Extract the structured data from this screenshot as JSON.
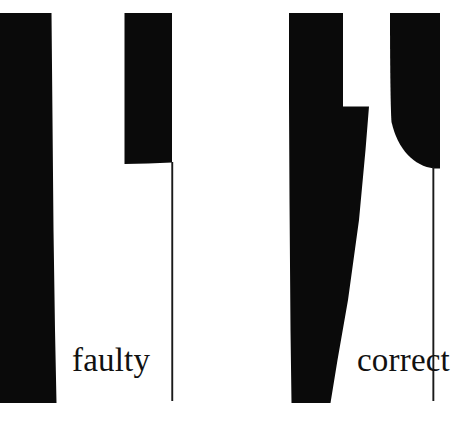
{
  "figure": {
    "background_color": "#ffffff",
    "ink_color": "#0a0a0a",
    "width": 461,
    "height": 432
  },
  "labels": {
    "left_caption": "faulty",
    "right_caption": "correct"
  },
  "panels": [
    {
      "id": "faulty",
      "caption": "faulty",
      "shapes": [
        {
          "name": "faulty-left-block",
          "kind": "filled-polygon",
          "description": "tall black bar flush to the left edge, slightly tapering",
          "points": "0,13 52,13 53,180 56,403 0,403"
        },
        {
          "name": "faulty-right-block",
          "kind": "filled-polygon",
          "description": "short black bar with flat bottom at mid height",
          "points": "124,13 172,13 172,163 124,164"
        },
        {
          "name": "faulty-centerline",
          "kind": "vertical-rule",
          "description": "thin vertical axis line below the right block",
          "x": 172,
          "y_top": 163,
          "y_bottom": 401
        }
      ]
    },
    {
      "id": "correct",
      "caption": "correct",
      "shapes": [
        {
          "name": "correct-left-block",
          "kind": "filled-polygon",
          "description": "tall black bar with a step out to the right at mid height and a tapering bottom",
          "points": "289,13 343,13 343,107 369,107 360,260 330,403 291,403"
        },
        {
          "name": "correct-right-block",
          "kind": "filled-polygon",
          "description": "black bar whose lower left edge sweeps out in a concave fillet to the base",
          "points": "390,13 440,13 440,168 434,168"
        },
        {
          "name": "correct-centerline",
          "kind": "vertical-rule",
          "description": "thin vertical axis line below the filleted block",
          "x": 433,
          "y_top": 168,
          "y_bottom": 401
        }
      ]
    }
  ]
}
